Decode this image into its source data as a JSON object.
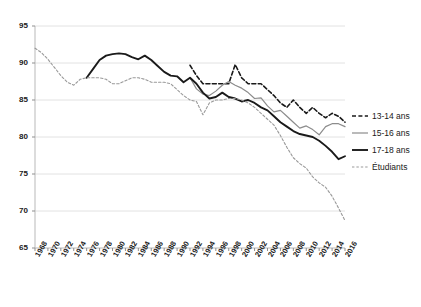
{
  "chart_data": {
    "type": "line",
    "title": "",
    "subtitle": "",
    "xlabel": "",
    "ylabel": "",
    "xlim": [
      1968,
      2016
    ],
    "ylim": [
      65,
      95
    ],
    "yticks": [
      65,
      70,
      75,
      80,
      85,
      90,
      95
    ],
    "grid": true,
    "legend_position": "right",
    "x": [
      1968,
      1970,
      1972,
      1974,
      1976,
      1978,
      1980,
      1982,
      1984,
      1986,
      1988,
      1990,
      1992,
      1994,
      1996,
      1998,
      2000,
      2002,
      2004,
      2006,
      2008,
      2010,
      2012,
      2014,
      2016
    ],
    "categories": [
      "1968",
      "1970",
      "1972",
      "1974",
      "1976",
      "1978",
      "1980",
      "1982",
      "1984",
      "1986",
      "1988",
      "1990",
      "1992",
      "1994",
      "1996",
      "1998",
      "2000",
      "2002",
      "2004",
      "2006",
      "2008",
      "2010",
      "2012",
      "2014",
      "2016"
    ],
    "series": [
      {
        "name": "13-14 ans",
        "style": "dashed",
        "color": "#1a1a1a",
        "x": [
          1992,
          1993,
          1994,
          1995,
          1996,
          1997,
          1998,
          1999,
          2000,
          2001,
          2002,
          2003,
          2004,
          2005,
          2006,
          2007,
          2008,
          2009,
          2010,
          2011,
          2012,
          2013,
          2014,
          2015,
          2016
        ],
        "values": [
          89.7,
          88.3,
          87.2,
          87.2,
          87.2,
          87.2,
          87.2,
          89.8,
          88.0,
          87.2,
          87.2,
          87.2,
          86.4,
          85.6,
          84.6,
          84.0,
          85.0,
          84.0,
          83.2,
          84.0,
          83.2,
          82.6,
          83.2,
          82.8,
          82.0
        ]
      },
      {
        "name": "15-16 ans",
        "style": "solid-thin",
        "color": "#8c8c8c",
        "x": [
          1992,
          1993,
          1994,
          1995,
          1996,
          1997,
          1998,
          1999,
          2000,
          2001,
          2002,
          2003,
          2004,
          2005,
          2006,
          2007,
          2008,
          2009,
          2010,
          2011,
          2012,
          2013,
          2014,
          2015,
          2016
        ],
        "values": [
          88.0,
          86.5,
          85.8,
          85.6,
          86.2,
          87.0,
          87.5,
          87.0,
          86.6,
          86.0,
          85.2,
          85.3,
          84.2,
          83.4,
          83.6,
          82.8,
          82.0,
          81.2,
          81.5,
          81.0,
          80.3,
          81.4,
          81.8,
          81.8,
          81.4
        ]
      },
      {
        "name": "17-18 ans",
        "style": "solid-thick",
        "color": "#1a1a1a",
        "x": [
          1976,
          1977,
          1978,
          1979,
          1980,
          1981,
          1982,
          1983,
          1984,
          1985,
          1986,
          1987,
          1988,
          1989,
          1990,
          1991,
          1992,
          1993,
          1994,
          1995,
          1996,
          1997,
          1998,
          1999,
          2000,
          2001,
          2002,
          2003,
          2004,
          2005,
          2006,
          2007,
          2008,
          2009,
          2010,
          2011,
          2012,
          2013,
          2014,
          2015,
          2016
        ],
        "values": [
          88.0,
          89.2,
          90.4,
          91.0,
          91.2,
          91.3,
          91.2,
          90.8,
          90.5,
          91.0,
          90.4,
          89.6,
          88.8,
          88.3,
          88.2,
          87.4,
          88.0,
          87.2,
          86.0,
          85.2,
          85.4,
          86.0,
          85.4,
          85.2,
          84.8,
          85.0,
          84.6,
          84.0,
          83.6,
          82.8,
          82.0,
          81.4,
          80.8,
          80.4,
          80.2,
          80.0,
          79.5,
          78.8,
          78.0,
          77.0,
          77.4
        ]
      },
      {
        "name": "Étudiants",
        "style": "dotted",
        "color": "#9a9a9a",
        "x": [
          1968,
          1969,
          1970,
          1971,
          1972,
          1973,
          1974,
          1975,
          1976,
          1977,
          1978,
          1979,
          1980,
          1981,
          1982,
          1983,
          1984,
          1985,
          1986,
          1987,
          1988,
          1989,
          1990,
          1991,
          1992,
          1993,
          1994,
          1995,
          1996,
          1997,
          1998,
          1999,
          2000,
          2001,
          2002,
          2003,
          2004,
          2005,
          2006,
          2007,
          2008,
          2009,
          2010,
          2011,
          2012,
          2013,
          2014,
          2015,
          2016
        ],
        "values": [
          92.0,
          91.4,
          90.5,
          89.4,
          88.3,
          87.4,
          87.0,
          87.8,
          88.0,
          88.0,
          88.0,
          87.8,
          87.2,
          87.2,
          87.6,
          88.0,
          88.0,
          87.8,
          87.4,
          87.4,
          87.4,
          87.2,
          86.4,
          85.6,
          85.0,
          84.8,
          83.0,
          84.6,
          85.0,
          85.0,
          85.2,
          85.2,
          85.0,
          84.6,
          84.0,
          83.2,
          82.4,
          81.6,
          80.2,
          78.6,
          77.2,
          76.4,
          75.8,
          74.6,
          73.8,
          73.2,
          72.0,
          70.4,
          68.7
        ]
      }
    ]
  },
  "legend": {
    "items": [
      {
        "label": "13-14 ans",
        "key": "dashed-line-key"
      },
      {
        "label": "15-16 ans",
        "key": "thin-gray-line-key"
      },
      {
        "label": "17-18 ans",
        "key": "thick-black-line-key"
      },
      {
        "label": "Étudiants",
        "key": "dotted-gray-line-key"
      }
    ]
  }
}
